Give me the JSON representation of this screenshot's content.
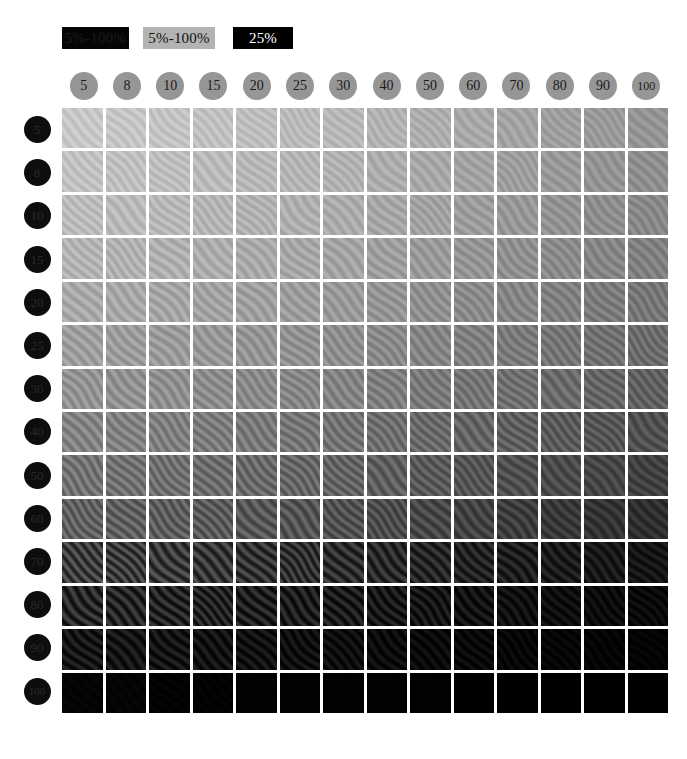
{
  "legend": {
    "items": [
      {
        "label": "5%-100%",
        "style": "dark-on-black",
        "name": "legend-dark-swatch"
      },
      {
        "label": "5%-100%",
        "style": "dark-on-gray",
        "name": "legend-gray-swatch"
      },
      {
        "label": "25%",
        "style": "white-on-black",
        "name": "legend-black-swatch"
      }
    ]
  },
  "axes": {
    "columns": [
      "5",
      "8",
      "10",
      "15",
      "20",
      "25",
      "30",
      "40",
      "50",
      "60",
      "70",
      "80",
      "90",
      "100"
    ],
    "rows": [
      "5",
      "8",
      "10",
      "15",
      "20",
      "25",
      "30",
      "40",
      "50",
      "60",
      "70",
      "80",
      "90",
      "100"
    ]
  },
  "colors": {
    "page_background": "#ffffff",
    "column_header_circle": "#969696",
    "column_header_text": "#1a1a1a",
    "row_header_circle": "#0d0d0d",
    "row_header_text": "#2a2a2a",
    "legend_gray_background": "#b3b3b3",
    "legend_black_background": "#000000",
    "cell_lightest": "#c8c8c8",
    "cell_darkest": "#000000"
  },
  "chart_data": {
    "type": "heatmap",
    "title": "",
    "xlabel": "",
    "ylabel": "",
    "x": [
      "5",
      "8",
      "10",
      "15",
      "20",
      "25",
      "30",
      "40",
      "50",
      "60",
      "70",
      "80",
      "90",
      "100"
    ],
    "y": [
      "5",
      "8",
      "10",
      "15",
      "20",
      "25",
      "30",
      "40",
      "50",
      "60",
      "70",
      "80",
      "90",
      "100"
    ],
    "cell_gray_levels": [
      [
        200,
        198,
        196,
        193,
        190,
        187,
        184,
        179,
        174,
        169,
        164,
        159,
        154,
        149
      ],
      [
        194,
        192,
        190,
        187,
        184,
        181,
        178,
        173,
        168,
        163,
        158,
        153,
        148,
        143
      ],
      [
        188,
        186,
        184,
        181,
        178,
        175,
        172,
        167,
        162,
        157,
        152,
        147,
        142,
        137
      ],
      [
        180,
        178,
        176,
        173,
        170,
        167,
        164,
        159,
        154,
        149,
        144,
        139,
        134,
        129
      ],
      [
        170,
        168,
        166,
        163,
        160,
        157,
        154,
        149,
        144,
        139,
        134,
        129,
        124,
        119
      ],
      [
        159,
        157,
        155,
        152,
        149,
        146,
        143,
        138,
        133,
        128,
        123,
        118,
        113,
        108
      ],
      [
        148,
        146,
        144,
        141,
        138,
        135,
        132,
        127,
        122,
        117,
        112,
        107,
        102,
        97
      ],
      [
        132,
        130,
        128,
        125,
        122,
        119,
        116,
        111,
        106,
        101,
        96,
        91,
        86,
        81
      ],
      [
        116,
        114,
        112,
        109,
        106,
        103,
        100,
        95,
        90,
        85,
        80,
        75,
        70,
        65
      ],
      [
        98,
        96,
        94,
        91,
        88,
        85,
        82,
        77,
        72,
        67,
        62,
        57,
        52,
        47
      ],
      [
        62,
        60,
        58,
        55,
        52,
        49,
        46,
        42,
        38,
        34,
        30,
        27,
        24,
        21
      ],
      [
        40,
        38,
        36,
        34,
        31,
        29,
        27,
        24,
        21,
        18,
        16,
        14,
        12,
        10
      ],
      [
        22,
        21,
        20,
        18,
        17,
        15,
        14,
        12,
        10,
        9,
        7,
        6,
        5,
        4
      ],
      [
        4,
        4,
        3,
        3,
        3,
        2,
        2,
        2,
        2,
        1,
        1,
        1,
        1,
        0
      ]
    ],
    "cell_texture_amplitude": [
      [
        10,
        10,
        10,
        10,
        10,
        10,
        10,
        10,
        10,
        10,
        10,
        10,
        10,
        10
      ],
      [
        11,
        11,
        11,
        11,
        11,
        11,
        11,
        11,
        11,
        11,
        11,
        11,
        11,
        11
      ],
      [
        12,
        12,
        12,
        12,
        12,
        12,
        12,
        12,
        12,
        12,
        12,
        12,
        12,
        12
      ],
      [
        13,
        13,
        13,
        13,
        13,
        13,
        13,
        13,
        13,
        13,
        13,
        13,
        13,
        13
      ],
      [
        14,
        14,
        14,
        14,
        14,
        14,
        14,
        14,
        14,
        14,
        14,
        14,
        14,
        14
      ],
      [
        15,
        15,
        15,
        15,
        15,
        15,
        15,
        15,
        15,
        15,
        15,
        15,
        15,
        15
      ],
      [
        16,
        16,
        16,
        16,
        16,
        16,
        16,
        16,
        16,
        16,
        16,
        16,
        16,
        16
      ],
      [
        18,
        18,
        18,
        18,
        18,
        18,
        18,
        18,
        18,
        18,
        18,
        17,
        16,
        15
      ],
      [
        20,
        20,
        20,
        20,
        20,
        20,
        20,
        19,
        18,
        17,
        16,
        15,
        14,
        13
      ],
      [
        22,
        22,
        22,
        22,
        21,
        21,
        20,
        19,
        18,
        17,
        16,
        14,
        13,
        12
      ],
      [
        30,
        30,
        29,
        28,
        27,
        26,
        25,
        23,
        21,
        19,
        17,
        15,
        13,
        11
      ],
      [
        26,
        25,
        24,
        23,
        22,
        21,
        20,
        18,
        16,
        14,
        12,
        10,
        9,
        8
      ],
      [
        16,
        15,
        15,
        14,
        13,
        12,
        11,
        10,
        9,
        8,
        6,
        5,
        4,
        3
      ],
      [
        2,
        2,
        2,
        2,
        1,
        1,
        1,
        1,
        1,
        1,
        0,
        0,
        0,
        0
      ]
    ],
    "legend_on": true,
    "grid_on": false,
    "legend_position": "top-left"
  }
}
